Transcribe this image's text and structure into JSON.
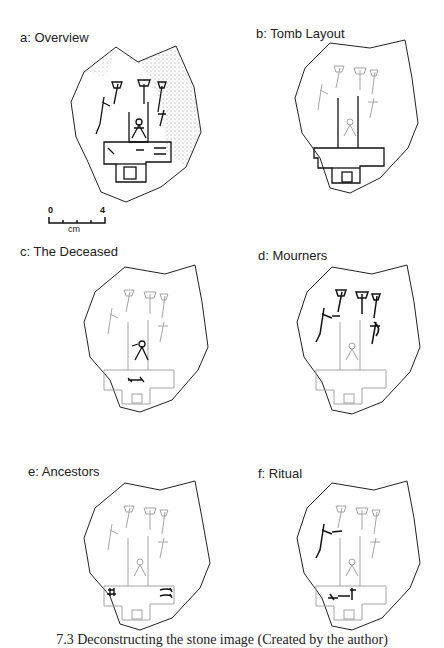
{
  "figure": {
    "panels": [
      {
        "id": "a",
        "label": "a: Overview",
        "highlight": "all",
        "shaded": true
      },
      {
        "id": "b",
        "label": "b: Tomb Layout",
        "highlight": "tomb"
      },
      {
        "id": "c",
        "label": "c: The Deceased",
        "highlight": "deceased"
      },
      {
        "id": "d",
        "label": "d: Mourners",
        "highlight": "mourners"
      },
      {
        "id": "e",
        "label": "e: Ancestors",
        "highlight": "ancestors"
      },
      {
        "id": "f",
        "label": "f: Ritual",
        "highlight": "ritual"
      }
    ],
    "scale_bar": {
      "min_label": "0",
      "max_label": "4",
      "unit": "cm",
      "ticks": 5
    },
    "caption": "7.3  Deconstructing the stone image (Created by the author)"
  },
  "colors": {
    "highlight": "#111111",
    "faint": "#9a9a9a",
    "outline": "#222222"
  }
}
